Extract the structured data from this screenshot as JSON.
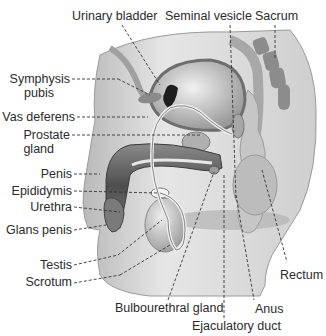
{
  "figure": {
    "labels": {
      "urinary_bladder": "Urinary bladder",
      "seminal_vesicle": "Seminal vesicle",
      "sacrum": "Sacrum",
      "symphysis_pubis_1": "Symphysis",
      "symphysis_pubis_2": "pubis",
      "vas_deferens": "Vas deferens",
      "prostate_gland_1": "Prostate",
      "prostate_gland_2": "gland",
      "penis": "Penis",
      "epididymis": "Epididymis",
      "urethra": "Urethra",
      "glans_penis": "Glans penis",
      "testis": "Testis",
      "scrotum": "Scrotum",
      "rectum": "Rectum",
      "bulbourethral_gland": "Bulbourethral gland",
      "anus": "Anus",
      "ejaculatory_duct": "Ejaculatory duct"
    },
    "colors": {
      "body": "#d6d6d6",
      "dark": "#5e5e5e",
      "organ": "#bdbdbd",
      "leader": "#333333"
    }
  }
}
